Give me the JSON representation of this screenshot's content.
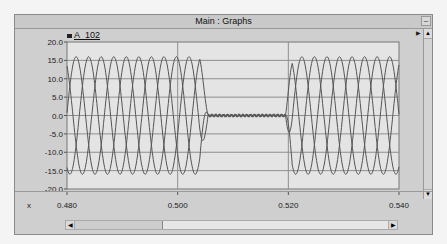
{
  "window": {
    "title": "Main : Graphs",
    "minimize_label": "–"
  },
  "legend": {
    "label": "A_102",
    "color": "#222222"
  },
  "axis": {
    "x_name": "x",
    "up_arrow": "▲",
    "down_arrow": "▼",
    "left_arrow": "◀",
    "right_arrow": "▶",
    "side_arrow": "▶"
  },
  "chart_data": {
    "type": "line",
    "title": "Main : Graphs",
    "xlabel": "x",
    "ylabel": "",
    "xlim": [
      0.48,
      0.54
    ],
    "ylim": [
      -20.0,
      20.0
    ],
    "x_ticks": [
      "0.480",
      "0.500",
      "0.520",
      "0.540"
    ],
    "x_tick_values": [
      0.48,
      0.5,
      0.52,
      0.54
    ],
    "y_ticks": [
      "20.0",
      "15.0",
      "10.0",
      "5.0",
      "0.0",
      "-5.0",
      "-10.0",
      "-15.0",
      "-20.0"
    ],
    "y_tick_values": [
      20,
      15,
      10,
      5,
      0,
      -5,
      -10,
      -15,
      -20
    ],
    "grid": true,
    "legend": [
      "A_102"
    ],
    "legend_position": "top-left",
    "series": [
      {
        "name": "phase_1",
        "amplitude": 16.0,
        "period": 0.0068,
        "peak_at": 0.48165
      },
      {
        "name": "phase_2",
        "amplitude": 16.0,
        "period": 0.0068,
        "peak_at": 0.48392
      },
      {
        "name": "phase_3",
        "amplitude": 16.0,
        "period": 0.0068,
        "peak_at": 0.48618
      }
    ],
    "collapse_interval": [
      0.5055,
      0.5195
    ],
    "line_color": "#555555"
  }
}
